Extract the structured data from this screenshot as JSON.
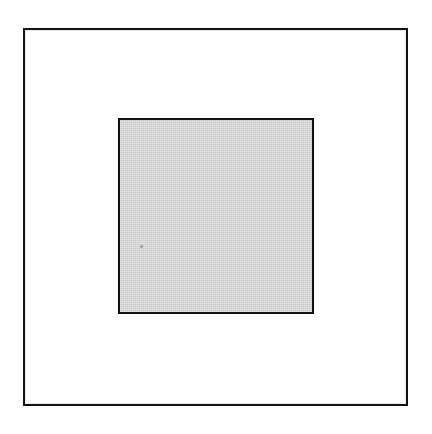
{
  "figure": {
    "type": "diagram",
    "canvas": {
      "width": 432,
      "height": 434,
      "background_color": "#ffffff"
    },
    "shapes": [
      {
        "name": "outer-frame",
        "shape": "rectangle",
        "fill_color": "#ffffff",
        "stroke_color": "#131313",
        "stroke_width": 2,
        "x": 23,
        "y": 28,
        "width": 385,
        "height": 378,
        "label": ""
      },
      {
        "name": "inner-square",
        "shape": "square",
        "fill_color": "#d2d2d2",
        "stroke_color": "#121212",
        "stroke_width": 2,
        "x": 118,
        "y": 118,
        "width": 196,
        "height": 196,
        "label": ""
      }
    ],
    "artifacts": [
      {
        "name": "scan-speck",
        "shape": "dot",
        "color": "#9a9a9a",
        "x": 140,
        "y": 245,
        "size": 3
      }
    ],
    "caption": ""
  }
}
